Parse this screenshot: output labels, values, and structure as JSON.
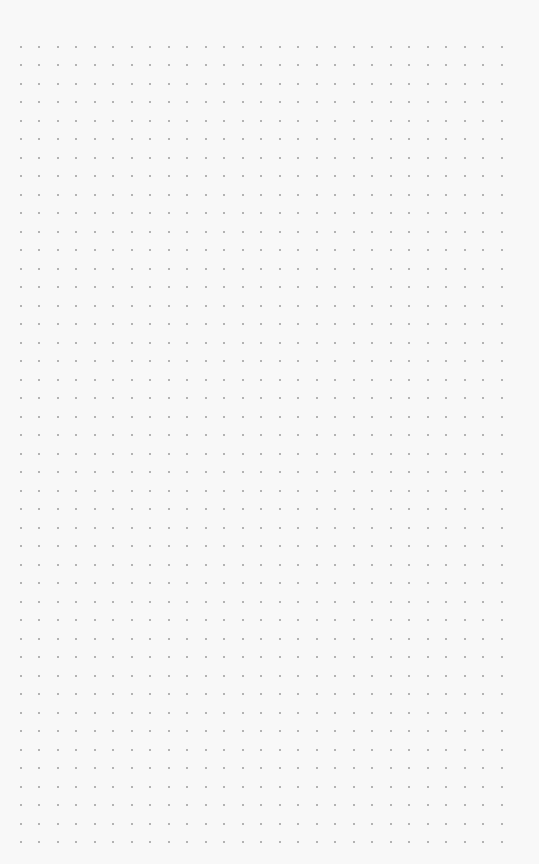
{
  "paper": {
    "type": "dot-grid",
    "background": "#f8f8f8",
    "dot_color": "#9c9c9c",
    "origin_x": 20.5,
    "origin_y": 46.5,
    "spacing_x": 18.5,
    "spacing_y": 18.5,
    "columns": 27,
    "rows": 44
  }
}
